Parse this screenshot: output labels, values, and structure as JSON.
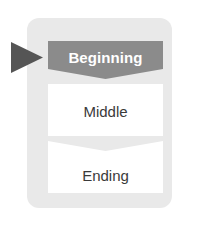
{
  "diagram": {
    "type": "vertical-chevron-process",
    "panel": {
      "background_color": "#e9e9e9"
    },
    "pointer": {
      "icon": "triangle-right-icon",
      "color": "#555555"
    },
    "stages": [
      {
        "label": "Beginning",
        "shape": "chevron-banner",
        "fill_color": "#8b8b8b",
        "text_color": "#ffffff",
        "selected": true
      },
      {
        "label": "Middle",
        "shape": "rectangle",
        "fill_color": "#ffffff",
        "text_color": "#3a3a3a",
        "selected": false
      },
      {
        "label": "Ending",
        "shape": "chevron-notched-rectangle",
        "fill_color": "#ffffff",
        "text_color": "#3a3a3a",
        "selected": false
      }
    ]
  }
}
